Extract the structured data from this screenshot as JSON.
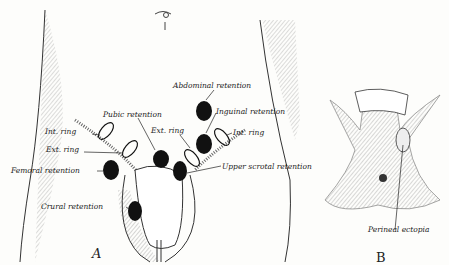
{
  "figure": {
    "panels": [
      {
        "id": "A",
        "label": "A"
      },
      {
        "id": "B",
        "label": "B"
      }
    ],
    "labels_A": {
      "abdominal_retention": "Abdominal retention",
      "inguinal_retention": "Inguinal retention",
      "pubic_retention": "Pubic retention",
      "int_ring_left": "Int. ring",
      "int_ring_right": "Int. ring",
      "ext_ring_left": "Ext. ring",
      "ext_ring_right": "Ext. ring",
      "femoral_retention": "Femoral retention",
      "upper_scrotal_retention": "Upper scrotal retention",
      "crural_retention": "Crural retention"
    },
    "labels_B": {
      "perineal_ectopia": "Perineal ectopia"
    }
  }
}
